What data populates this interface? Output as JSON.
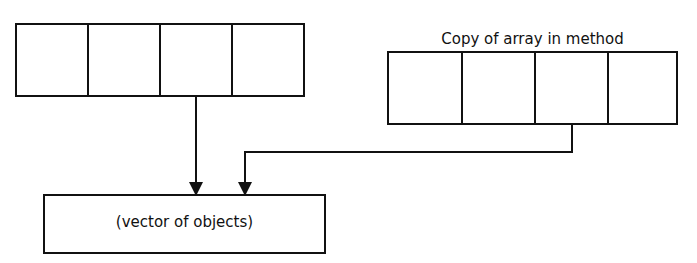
{
  "diagram": {
    "left_array": {
      "cells": 4
    },
    "right_array": {
      "title": "Copy of array in method",
      "cells": 4
    },
    "target_box": {
      "label": "(vector of objects)"
    },
    "arrows": [
      {
        "from": "left_array.cell_3",
        "to": "target_box"
      },
      {
        "from": "right_array.cell_3",
        "to": "target_box"
      }
    ],
    "colors": {
      "stroke": "#111111",
      "background": "#ffffff"
    }
  }
}
